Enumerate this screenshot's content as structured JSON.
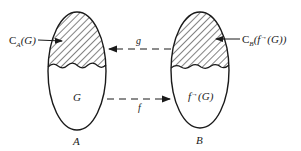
{
  "diagram": {
    "sets": [
      {
        "name": "A",
        "label": "A",
        "inner_label": "G",
        "complement_label": "C_A(G)",
        "complement_prefix": "C",
        "complement_sub": "A",
        "complement_arg": "(G)"
      },
      {
        "name": "B",
        "label": "B",
        "inner_label": "f→(G)",
        "inner_prefix": "f",
        "inner_sup": "→",
        "inner_arg": "(G)",
        "complement_label": "C_B(f→(G))",
        "complement_prefix": "C",
        "complement_sub": "B",
        "complement_arg_prefix": "(f",
        "complement_arg_sup": "→",
        "complement_arg_suffix": "(G))"
      }
    ],
    "arrows": [
      {
        "label": "g",
        "from": "B",
        "to": "A",
        "style": "dashed"
      },
      {
        "label": "f",
        "from": "A",
        "to": "B",
        "style": "dashed"
      }
    ],
    "colors": {
      "ink": "#1a1a1a",
      "background": "#ffffff"
    }
  }
}
